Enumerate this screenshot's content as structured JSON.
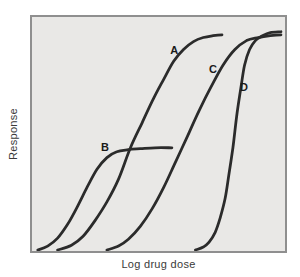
{
  "figure": {
    "ylabel": "Response",
    "xlabel": "Log drug dose"
  },
  "colors": {
    "page_background": "#ffffff",
    "plot_background": "#e9e8e6",
    "plot_border": "#8f8f8f",
    "curve": "#2b2b2b",
    "axis_text": "#3a3a3a",
    "label_text": "#1a1a1a"
  },
  "chart_data": {
    "type": "line",
    "title": "",
    "xlabel": "Log drug dose",
    "ylabel": "Response",
    "xlim": [
      0,
      100
    ],
    "ylim": [
      0,
      100
    ],
    "grid": false,
    "legend": "none",
    "axis_ticks": "none",
    "x_units": "relative log-dose position (% of axis)",
    "y_units": "response (% of axis height)",
    "series": [
      {
        "name": "A",
        "label_pos": [
          55.3,
          86.1
        ],
        "points": [
          [
            10.1,
            0.4
          ],
          [
            15.6,
            2.5
          ],
          [
            20.2,
            6.3
          ],
          [
            24.9,
            13.0
          ],
          [
            29.6,
            21.0
          ],
          [
            34.2,
            30.7
          ],
          [
            38.9,
            44.1
          ],
          [
            43.6,
            55.0
          ],
          [
            48.2,
            65.5
          ],
          [
            52.1,
            73.5
          ],
          [
            56.0,
            81.1
          ],
          [
            59.9,
            86.1
          ],
          [
            63.8,
            89.5
          ],
          [
            67.7,
            91.2
          ],
          [
            71.6,
            92.0
          ],
          [
            75.1,
            92.4
          ]
        ]
      },
      {
        "name": "B",
        "label_pos": [
          28.4,
          45.4
        ],
        "points": [
          [
            2.3,
            0.4
          ],
          [
            6.2,
            2.1
          ],
          [
            10.1,
            5.5
          ],
          [
            14.0,
            11.3
          ],
          [
            17.9,
            18.9
          ],
          [
            21.8,
            27.3
          ],
          [
            25.7,
            34.9
          ],
          [
            29.6,
            39.9
          ],
          [
            33.5,
            42.4
          ],
          [
            38.1,
            43.3
          ],
          [
            42.8,
            43.7
          ],
          [
            48.6,
            44.1
          ],
          [
            55.3,
            44.1
          ]
        ]
      },
      {
        "name": "C",
        "label_pos": [
          70.4,
          78.2
        ],
        "points": [
          [
            29.6,
            0.4
          ],
          [
            34.2,
            2.1
          ],
          [
            38.1,
            5.0
          ],
          [
            42.8,
            10.5
          ],
          [
            47.5,
            18.1
          ],
          [
            52.1,
            27.3
          ],
          [
            56.8,
            38.2
          ],
          [
            61.5,
            49.2
          ],
          [
            66.1,
            60.1
          ],
          [
            70.8,
            70.2
          ],
          [
            75.5,
            79.4
          ],
          [
            80.2,
            86.1
          ],
          [
            84.8,
            89.9
          ],
          [
            89.5,
            91.2
          ],
          [
            94.2,
            92.0
          ],
          [
            98.4,
            92.4
          ]
        ]
      },
      {
        "name": "D",
        "label_pos": [
          82.5,
          70.6
        ],
        "points": [
          [
            64.6,
            0.4
          ],
          [
            67.7,
            1.7
          ],
          [
            70.0,
            3.8
          ],
          [
            72.4,
            8.0
          ],
          [
            74.3,
            13.9
          ],
          [
            76.3,
            22.3
          ],
          [
            77.8,
            32.4
          ],
          [
            79.4,
            44.1
          ],
          [
            80.9,
            57.6
          ],
          [
            82.5,
            69.3
          ],
          [
            84.0,
            79.4
          ],
          [
            86.0,
            86.1
          ],
          [
            88.3,
            89.9
          ],
          [
            91.1,
            92.0
          ],
          [
            94.2,
            93.3
          ],
          [
            98.4,
            93.7
          ]
        ]
      }
    ]
  }
}
